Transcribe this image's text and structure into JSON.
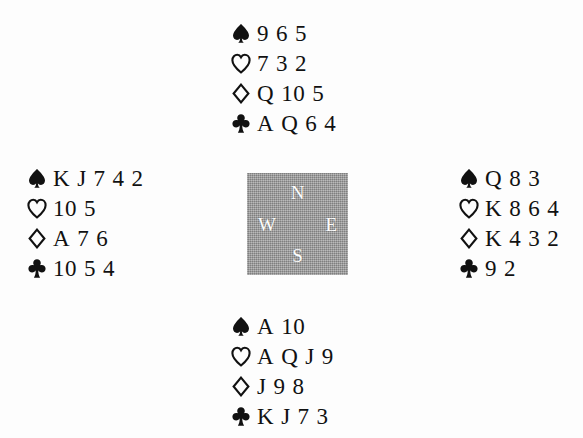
{
  "diagram": {
    "type": "bridge-deal",
    "background_color": "#fdfdfd",
    "ink_color": "#111111"
  },
  "compass": {
    "box_color": "#9d9d9d",
    "letter_color": "#fdfdfd",
    "north": "N",
    "west": "W",
    "east": "E",
    "south": "S"
  },
  "suits": {
    "spade": {
      "name": "spade-icon",
      "glyph": "♠",
      "filled": true
    },
    "heart": {
      "name": "heart-icon",
      "glyph": "♡",
      "filled": false
    },
    "diamond": {
      "name": "diamond-icon",
      "glyph": "♢",
      "filled": false
    },
    "club": {
      "name": "club-icon",
      "glyph": "♣",
      "filled": true
    }
  },
  "hands": {
    "north": {
      "label": "North",
      "spades": [
        "9",
        "6",
        "5"
      ],
      "hearts": [
        "7",
        "3",
        "2"
      ],
      "diamonds": [
        "Q",
        "10",
        "5"
      ],
      "clubs": [
        "A",
        "Q",
        "6",
        "4"
      ]
    },
    "west": {
      "label": "West",
      "spades": [
        "K",
        "J",
        "7",
        "4",
        "2"
      ],
      "hearts": [
        "10",
        "5"
      ],
      "diamonds": [
        "A",
        "7",
        "6"
      ],
      "clubs": [
        "10",
        "5",
        "4"
      ]
    },
    "east": {
      "label": "East",
      "spades": [
        "Q",
        "8",
        "3"
      ],
      "hearts": [
        "K",
        "8",
        "6",
        "4"
      ],
      "diamonds": [
        "K",
        "4",
        "3",
        "2"
      ],
      "clubs": [
        "9",
        "2"
      ]
    },
    "south": {
      "label": "South",
      "spades": [
        "A",
        "10"
      ],
      "hearts": [
        "A",
        "Q",
        "J",
        "9"
      ],
      "diamonds": [
        "J",
        "9",
        "8"
      ],
      "clubs": [
        "K",
        "J",
        "7",
        "3"
      ]
    }
  }
}
